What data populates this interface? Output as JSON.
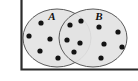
{
  "figure": {
    "type": "venn-diagram",
    "width": 138,
    "height": 81,
    "background_color": "#ffffff",
    "caption": ""
  },
  "frame": {
    "name": "axis-frame",
    "stroke_color": "#2b2b2b",
    "stroke_width": 2.2,
    "left_x": 21,
    "top_y": 0,
    "bottom_y": 70,
    "right_x": 138,
    "description": "dark L-shaped border: vertical line at left, horizontal line at bottom"
  },
  "sets": [
    {
      "id": "A",
      "label": "A",
      "label_x": 52,
      "label_y": 20,
      "center_x": 57,
      "center_y": 38,
      "radius_x": 34,
      "radius_y": 29,
      "fill_color": "#e3e3e3",
      "stroke_color": "#5a5a5a"
    },
    {
      "id": "B",
      "label": "B",
      "label_x": 99,
      "label_y": 20,
      "center_x": 93,
      "center_y": 38,
      "radius_x": 34,
      "radius_y": 29,
      "fill_color": "#e3e3e3",
      "stroke_color": "#5a5a5a"
    }
  ],
  "dot_style": {
    "fill_color": "#141414",
    "radius": 2.6
  },
  "regions": [
    {
      "id": "A-only",
      "name": "region-a-only",
      "count": 5,
      "dots": [
        {
          "x": 41,
          "y": 23
        },
        {
          "x": 29,
          "y": 36
        },
        {
          "x": 50,
          "y": 39
        },
        {
          "x": 40,
          "y": 51
        },
        {
          "x": 58,
          "y": 58
        }
      ]
    },
    {
      "id": "A-intersect-B",
      "name": "region-intersection",
      "count": 5,
      "dots": [
        {
          "x": 70,
          "y": 25
        },
        {
          "x": 81,
          "y": 21
        },
        {
          "x": 67,
          "y": 40
        },
        {
          "x": 80,
          "y": 43
        },
        {
          "x": 74,
          "y": 52
        }
      ]
    },
    {
      "id": "B-only",
      "name": "region-b-only",
      "count": 5,
      "dots": [
        {
          "x": 99,
          "y": 27
        },
        {
          "x": 118,
          "y": 32
        },
        {
          "x": 104,
          "y": 44
        },
        {
          "x": 122,
          "y": 47
        },
        {
          "x": 101,
          "y": 58
        }
      ]
    }
  ],
  "chart_data": {
    "type": "venn",
    "title": "",
    "sets": [
      "A",
      "B"
    ],
    "region_counts": {
      "A_only": 5,
      "intersection": 5,
      "B_only": 5,
      "A_total": 10,
      "B_total": 10,
      "universe_total": 15
    },
    "categories": [
      "A only",
      "A ∩ B",
      "B only"
    ],
    "values": [
      5,
      5,
      5
    ],
    "xlabel": "",
    "ylabel": "",
    "legend": [
      "A",
      "B"
    ],
    "grid": false
  }
}
